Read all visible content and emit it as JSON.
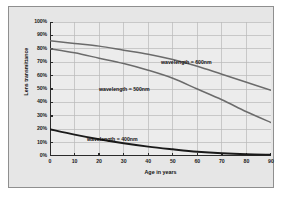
{
  "chart_data": {
    "type": "line",
    "title": "",
    "xlabel": "Age in years",
    "ylabel": "Lens transmittance",
    "xlim": [
      0,
      90
    ],
    "ylim": [
      0,
      100
    ],
    "grid": true,
    "legend_position": "inline-annotations",
    "x_ticks": [
      "0",
      "10",
      "20",
      "30",
      "40",
      "50",
      "60",
      "70",
      "80",
      "90"
    ],
    "y_ticks": [
      "0%",
      "10%",
      "20%",
      "30%",
      "40%",
      "50%",
      "60%",
      "70%",
      "80%",
      "90%",
      "100%"
    ],
    "x": [
      0,
      10,
      20,
      30,
      40,
      50,
      60,
      70,
      80,
      90
    ],
    "series": [
      {
        "name": "wavelength = 600nm",
        "label": "wavelength = 600nm",
        "color": "#6b6b6b",
        "values": [
          86,
          84,
          82,
          79,
          76,
          72,
          67,
          61,
          55,
          49
        ]
      },
      {
        "name": "wavelength = 500nm",
        "label": "wavelength = 500nm",
        "color": "#6b6b6b",
        "values": [
          80,
          77,
          73,
          69,
          64,
          58,
          50,
          42,
          33,
          25
        ]
      },
      {
        "name": "wavelength = 400nm",
        "label": "wavelength = 400nm",
        "color": "#1a1a1a",
        "values": [
          20,
          16,
          12.5,
          9.5,
          7,
          5,
          3.2,
          2,
          1.3,
          1
        ]
      }
    ]
  },
  "annotations": {
    "label_600": "wavelength = 600nm",
    "label_500": "wavelength = 500nm",
    "label_400": "wavelength = 400nm"
  },
  "colors": {
    "canvas_background": "#e6e6e6",
    "plot_background": "#ececec",
    "grid": "#b9b9b9",
    "axis": "#2b2b2b",
    "series_gray": "#6b6b6b",
    "series_black": "#1a1a1a",
    "border": "#8f8f8f"
  }
}
